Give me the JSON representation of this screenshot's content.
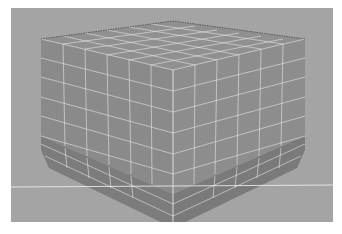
{
  "caption": "",
  "viewport": {
    "label": "3D modeling viewport",
    "background": "#a4a4a4",
    "model": {
      "name": "subdivided cube with beveled base",
      "face_color_top": "#8e8e8e",
      "face_color_left": "#8a8a8a",
      "face_color_right": "#8c8c8c",
      "base_color": "#7e7e7e",
      "wire_color": "#e8e8e8",
      "grid_divisions": 6
    },
    "horizon_line_color": "#f0f0f0"
  }
}
